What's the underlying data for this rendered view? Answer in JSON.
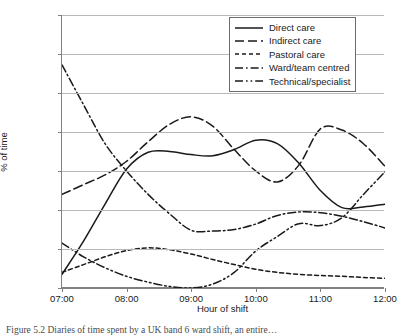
{
  "figure": {
    "caption": "Figure 5.2 Diaries of time spent by a UK band 6 ward shift, an entire…"
  },
  "axes": {
    "y_title": "% of time",
    "x_title": "Hour of shift",
    "y_ticks": [
      "0%",
      "10%",
      "20%",
      "30%",
      "40%",
      "50%",
      "60%",
      "70%"
    ],
    "x_ticks": [
      "07:00",
      "08:00",
      "09:00",
      "10:00",
      "11:00",
      "12:00"
    ]
  },
  "legend": {
    "items": [
      {
        "label": "Direct care",
        "style": "solid",
        "swatch": "direct-care-swatch"
      },
      {
        "label": "Indirect care",
        "style": "long-dash",
        "swatch": "indirect-care-swatch"
      },
      {
        "label": "Pastoral care",
        "style": "short-dash",
        "swatch": "pastoral-care-swatch"
      },
      {
        "label": "Ward/team centred",
        "style": "dash-dot",
        "swatch": "ward-team-centred-swatch"
      },
      {
        "label": "Technical/specialist",
        "style": "dash-dot-dot",
        "swatch": "technical-specialist-swatch"
      }
    ]
  },
  "chart_data": {
    "type": "line",
    "title": "",
    "xlabel": "Hour of shift",
    "ylabel": "% of time",
    "xlim": [
      "07:00",
      "12:00"
    ],
    "ylim": [
      0,
      70
    ],
    "ytick_step": 10,
    "grid": "horizontal",
    "legend_position": "top-right",
    "x": [
      "07:00",
      "07:20",
      "07:40",
      "08:00",
      "08:20",
      "08:40",
      "09:00",
      "09:20",
      "09:40",
      "10:00",
      "10:20",
      "10:40",
      "11:00",
      "11:20",
      "11:40",
      "12:00"
    ],
    "series": [
      {
        "name": "Direct care",
        "style": "solid",
        "values": [
          3.5,
          12.0,
          21.5,
          30.5,
          34.8,
          35.0,
          34.2,
          33.9,
          35.5,
          37.9,
          37.0,
          32.0,
          25.0,
          20.6,
          20.8,
          21.5
        ]
      },
      {
        "name": "Indirect care",
        "style": "long-dash",
        "values": [
          24.0,
          26.5,
          29.0,
          32.5,
          37.5,
          42.0,
          43.9,
          41.5,
          35.5,
          30.0,
          27.2,
          31.5,
          40.8,
          40.5,
          37.0,
          31.2
        ]
      },
      {
        "name": "Pastoral care",
        "style": "short-dash",
        "values": [
          4.0,
          6.0,
          8.0,
          9.6,
          10.3,
          9.8,
          8.7,
          7.3,
          6.0,
          4.8,
          4.0,
          3.5,
          3.2,
          3.0,
          2.7,
          2.5
        ]
      },
      {
        "name": "Ward/team centred",
        "style": "dash-dot",
        "values": [
          57.2,
          47.0,
          37.0,
          30.0,
          24.0,
          19.0,
          14.8,
          14.6,
          15.0,
          16.4,
          18.6,
          19.5,
          19.3,
          18.4,
          17.0,
          15.4
        ]
      },
      {
        "name": "Technical/specialist",
        "style": "dash-dot-dot",
        "values": [
          11.5,
          8.0,
          5.2,
          3.0,
          1.5,
          0.4,
          0.0,
          1.0,
          4.0,
          9.5,
          13.2,
          16.5,
          16.0,
          18.0,
          24.0,
          29.8
        ]
      }
    ]
  }
}
